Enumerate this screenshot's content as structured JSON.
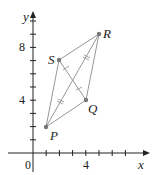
{
  "figure": {
    "axes": {
      "x_label": "x",
      "y_label": "y",
      "origin_label": "0",
      "x_tick_label": "4",
      "y_tick_labels": [
        "4",
        "8"
      ]
    },
    "points": [
      {
        "label": "P",
        "x": 1,
        "y": 2
      },
      {
        "label": "Q",
        "x": 4,
        "y": 4
      },
      {
        "label": "R",
        "x": 5,
        "y": 9
      },
      {
        "label": "S",
        "x": 2,
        "y": 7
      }
    ],
    "colors": {
      "line": "#888888",
      "point": "#777777",
      "axis": "#222222"
    }
  }
}
